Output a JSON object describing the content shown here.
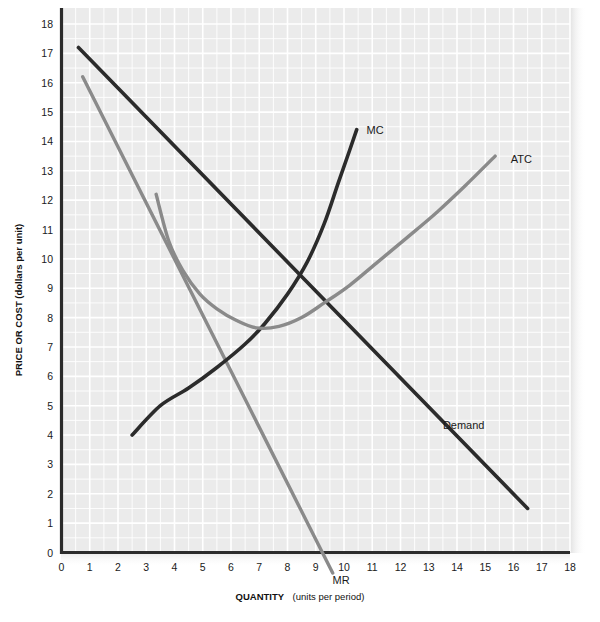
{
  "chart_data": {
    "type": "line",
    "title": "",
    "xlabel": "QUANTITY (units per period)",
    "xlabel_bold_part": "QUANTITY",
    "xlabel_normal_part": "(units per period)",
    "ylabel": "PRICE OR COST (dollars per unit)",
    "xlim": [
      0,
      18
    ],
    "ylim": [
      0,
      18
    ],
    "grid": true,
    "grid_color": "#ffffff",
    "plot_background": "#ebebeb",
    "legend_position": "inline-annotations",
    "xticks": [
      "0",
      "1",
      "2",
      "3",
      "4",
      "5",
      "6",
      "7",
      "8",
      "9",
      "10",
      "11",
      "12",
      "13",
      "14",
      "15",
      "16",
      "17",
      "18"
    ],
    "yticks": [
      "0",
      "1",
      "2",
      "3",
      "4",
      "5",
      "6",
      "7",
      "8",
      "9",
      "10",
      "11",
      "12",
      "13",
      "14",
      "15",
      "16",
      "17",
      "18"
    ],
    "series": [
      {
        "name": "Demand",
        "label": "Demand",
        "color": "#2b2b2b",
        "width": 3.6,
        "kind": "line",
        "points": [
          [
            0.6,
            17.2
          ],
          [
            16.5,
            1.5
          ]
        ]
      },
      {
        "name": "MR",
        "label": "MR",
        "color": "#8a8a8a",
        "width": 3.4,
        "kind": "line",
        "points": [
          [
            0.75,
            16.2
          ],
          [
            9.6,
            -0.7
          ]
        ]
      },
      {
        "name": "MC",
        "label": "MC",
        "color": "#2b2b2b",
        "width": 3.6,
        "kind": "curve",
        "points": [
          [
            2.5,
            4.0
          ],
          [
            3.5,
            5.0
          ],
          [
            4.5,
            5.6
          ],
          [
            5.5,
            6.3
          ],
          [
            6.5,
            7.1
          ],
          [
            7.2,
            7.8
          ],
          [
            8.0,
            8.8
          ],
          [
            8.7,
            9.9
          ],
          [
            9.3,
            11.2
          ],
          [
            9.8,
            12.6
          ],
          [
            10.2,
            13.7
          ],
          [
            10.45,
            14.4
          ]
        ]
      },
      {
        "name": "ATC",
        "label": "ATC",
        "color": "#8a8a8a",
        "width": 3.4,
        "kind": "curve",
        "points": [
          [
            3.35,
            12.2
          ],
          [
            3.8,
            10.6
          ],
          [
            4.3,
            9.6
          ],
          [
            4.9,
            8.8
          ],
          [
            5.5,
            8.3
          ],
          [
            6.2,
            7.9
          ],
          [
            6.9,
            7.65
          ],
          [
            7.7,
            7.7
          ],
          [
            8.5,
            8.0
          ],
          [
            9.3,
            8.5
          ],
          [
            10.2,
            9.1
          ],
          [
            11.2,
            9.9
          ],
          [
            12.2,
            10.7
          ],
          [
            13.3,
            11.6
          ],
          [
            14.3,
            12.5
          ],
          [
            15.35,
            13.5
          ]
        ]
      }
    ],
    "annotations": [
      {
        "name": "mc-label",
        "text": "MC",
        "x": 10.8,
        "y": 14.4
      },
      {
        "name": "atc-label",
        "text": "ATC",
        "x": 15.9,
        "y": 13.4
      },
      {
        "name": "demand-label",
        "text": "Demand",
        "x": 13.5,
        "y": 4.35
      },
      {
        "name": "mr-label",
        "text": "MR",
        "x": 9.9,
        "y": -0.95
      }
    ]
  }
}
